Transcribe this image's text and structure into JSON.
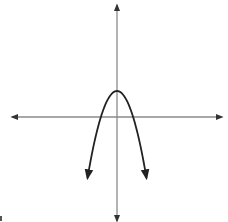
{
  "chart_data": {
    "type": "line",
    "title": "",
    "xlabel": "",
    "ylabel": "",
    "grid": false,
    "legend": null,
    "ticks": "none",
    "function_estimate": "y = -x^2 + 2",
    "series": [
      {
        "name": "parabola",
        "x": [
          -2.2,
          -1.5,
          -1.0,
          -0.5,
          0,
          0.5,
          1.0,
          1.5,
          2.2
        ],
        "y": [
          -2.84,
          -0.25,
          1.0,
          1.75,
          2.0,
          1.75,
          1.0,
          -0.25,
          -2.84
        ]
      }
    ],
    "vertex": [
      0,
      2
    ],
    "x_intercepts": [
      -1.41,
      1.41
    ],
    "xlim": [
      -8,
      8
    ],
    "ylim": [
      -8,
      8.5
    ],
    "colors": {
      "axes": "#7a7a7a",
      "curve": "#222222",
      "background": "#ffffff"
    }
  },
  "pixel_geometry": {
    "origin": [
      117,
      117
    ],
    "vertex_px": [
      117,
      91
    ],
    "x_axis": {
      "from": 12,
      "to": 222
    },
    "y_axis": {
      "from": 4,
      "to": 222
    },
    "left_end_px": [
      88,
      178
    ],
    "right_end_px": [
      147,
      178
    ]
  }
}
